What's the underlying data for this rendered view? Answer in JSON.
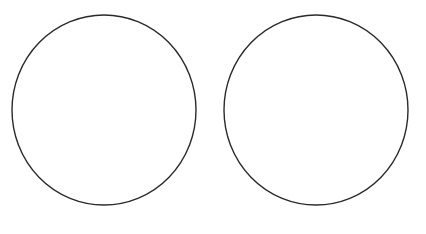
{
  "diagram": {
    "background": "#ffffff",
    "stroke_color": "#2a2a2a",
    "stroke_width": 1.4,
    "shapes": [
      {
        "type": "circle",
        "name": "left-circle",
        "cx": 104,
        "cy": 110,
        "rx": 92,
        "ry": 95
      },
      {
        "type": "circle",
        "name": "right-circle",
        "cx": 316,
        "cy": 110,
        "rx": 92,
        "ry": 95
      }
    ]
  }
}
